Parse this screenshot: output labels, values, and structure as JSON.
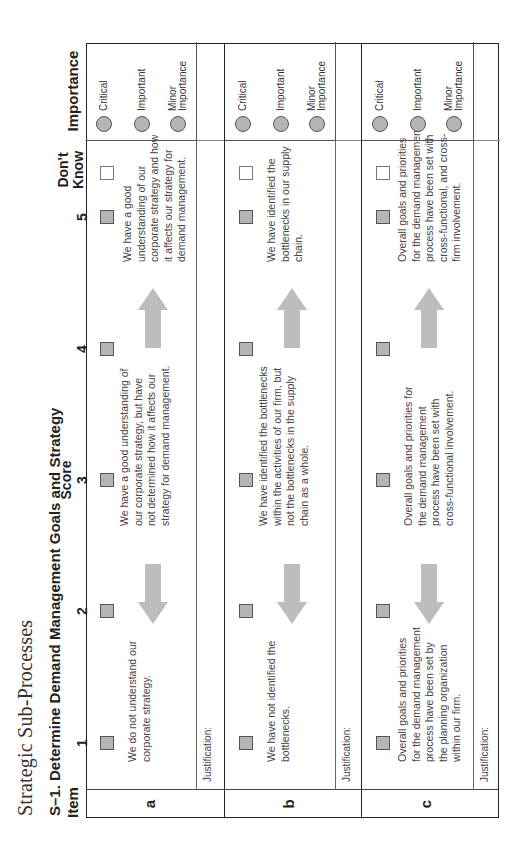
{
  "section_title": "Strategic Sub-Processes",
  "subprocess_title": "S–1. Determine Demand Management Goals and Strategy",
  "headers": {
    "item": "Item",
    "score": "Score",
    "score_columns": [
      "1",
      "2",
      "3",
      "4",
      "5"
    ],
    "dont_know_line1": "Don't",
    "dont_know_line2": "Know",
    "importance": "Importance"
  },
  "importance_options": [
    "Critical",
    "Important",
    "Minor Importance"
  ],
  "importance_option_lines": [
    [
      "Critical"
    ],
    [
      "Important"
    ],
    [
      "Minor",
      "Importance"
    ]
  ],
  "justification_label": "Justification:",
  "colors": {
    "checkbox_fill": "#b5b5b5",
    "arrow": "#bdbdbd",
    "border": "#222222"
  },
  "items": [
    {
      "letter": "a",
      "score_1": "We do not understand our corporate strategy.",
      "score_3": "We have a good understanding of our corporate strategy, but have not determined how it affects our strategy for demand management.",
      "score_5": "We have a good understanding of our corporate strategy and how it affects our strategy for demand management.",
      "justification": "Justification:"
    },
    {
      "letter": "b",
      "score_1": "We have not identified the bottlenecks.",
      "score_3": "We have identified the bottlenecks within the activities of our firm, but not the bottlenecks in the supply chain as a whole.",
      "score_5": "We have identified the bottlenecks in our supply chain.",
      "justification": "Justification:"
    },
    {
      "letter": "c",
      "score_1": "Overall goals and priorities for the demand management process have been set by the planning organization within our firm.",
      "score_3": "Overall goals and priorities for the demand management process have been set with cross-functional involvement.",
      "score_5": "Overall goals and priorities for the demand management process have been set with cross-functional, and cross-firm involvement.",
      "justification": "Justification:"
    }
  ]
}
